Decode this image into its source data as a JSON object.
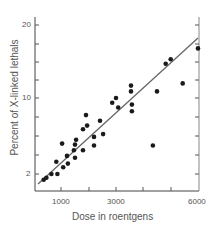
{
  "chart_data": {
    "type": "scatter",
    "title": "",
    "xlabel": "Dose in roentgens",
    "ylabel": "Percent of X-linked lethals",
    "x_ticks": [
      1000,
      3000,
      6000
    ],
    "y_ticks": [
      2,
      10,
      20
    ],
    "xlim": [
      0,
      6000
    ],
    "ylim": [
      0,
      21
    ],
    "grid": false,
    "legend": null,
    "series": [
      {
        "name": "observations",
        "marker": "filled-circle",
        "points": [
          [
            370,
            1.4
          ],
          [
            470,
            1.6
          ],
          [
            650,
            2.0
          ],
          [
            870,
            2.0
          ],
          [
            830,
            3.3
          ],
          [
            1040,
            5.2
          ],
          [
            1080,
            2.7
          ],
          [
            1220,
            3.9
          ],
          [
            1250,
            3.1
          ],
          [
            1470,
            4.5
          ],
          [
            1510,
            3.7
          ],
          [
            1510,
            5.1
          ],
          [
            1550,
            5.6
          ],
          [
            1800,
            4.5
          ],
          [
            1800,
            6.7
          ],
          [
            1910,
            8.2
          ],
          [
            1950,
            7.1
          ],
          [
            2200,
            5.0
          ],
          [
            2200,
            5.9
          ],
          [
            2420,
            7.6
          ],
          [
            2530,
            6.2
          ],
          [
            2860,
            9.5
          ],
          [
            3000,
            10.0
          ],
          [
            3080,
            9.0
          ],
          [
            3550,
            11.7
          ],
          [
            3550,
            10.9
          ],
          [
            3580,
            8.6
          ],
          [
            3580,
            9.3
          ],
          [
            4350,
            5.0
          ],
          [
            4500,
            10.9
          ],
          [
            4820,
            14.7
          ],
          [
            5000,
            15.3
          ],
          [
            5440,
            12.0
          ],
          [
            6000,
            16.8
          ]
        ]
      },
      {
        "name": "fit line",
        "type": "line",
        "points": [
          [
            120,
            1.1
          ],
          [
            6000,
            18.2
          ]
        ]
      }
    ]
  },
  "axes": {
    "x_tick_labels": [
      "1000",
      "3000",
      "6000"
    ],
    "y_tick_labels": [
      "20",
      "10",
      "2"
    ],
    "xlabel": "Dose in roentgens",
    "ylabel": "Percent of X-linked lethals"
  }
}
